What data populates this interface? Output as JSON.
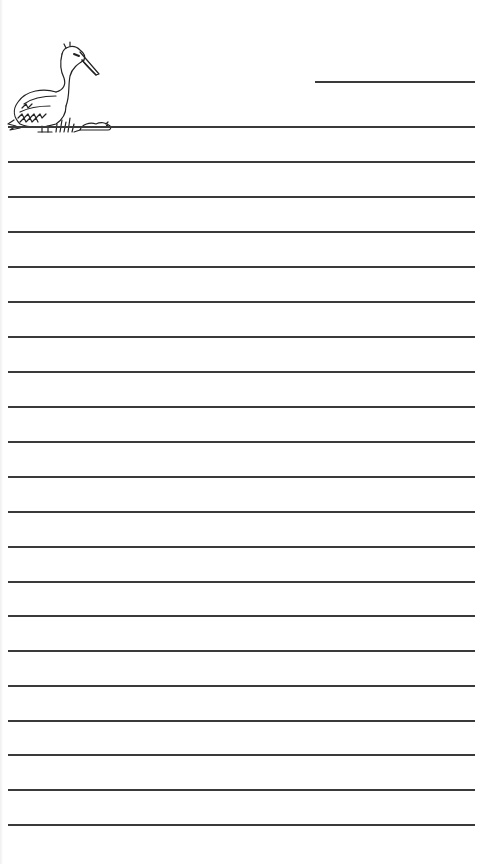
{
  "page": {
    "type": "lined-stationery",
    "background_color": "#ffffff",
    "line_color": "#3a3a3a",
    "header_line": {
      "kind": "short-title-line",
      "top": 81
    },
    "first_line_top": 126,
    "line_spacing": 35,
    "line_count": 21
  },
  "illustration": {
    "icon": "pelican-icon",
    "description": "Pelican standing in grass next to a small rodent"
  }
}
